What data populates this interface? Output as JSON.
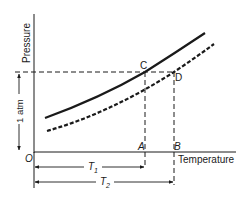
{
  "diagram": {
    "y_axis_label": "Pressure",
    "x_axis_label": "Temperature",
    "origin_label": "O",
    "pressure_level_label": "1 atm",
    "points": {
      "C": "C",
      "D": "D",
      "A": "A",
      "B": "B"
    },
    "temperature_marks": {
      "T1": {
        "base": "T",
        "sub": "1"
      },
      "T2": {
        "base": "T",
        "sub": "2"
      }
    },
    "curves": [
      {
        "name": "solid-curve",
        "style": "solid",
        "passes_through": "C"
      },
      {
        "name": "dashed-curve",
        "style": "dashed",
        "passes_through": "D"
      }
    ],
    "colors": {
      "ink": "#1a1a1a",
      "background": "#ffffff"
    }
  }
}
